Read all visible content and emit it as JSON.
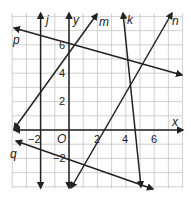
{
  "graph": {
    "axes": {
      "x_label": "x",
      "y_label": "y",
      "origin_label": "O"
    },
    "x_ticks": [
      {
        "value": -2,
        "label": "−2"
      },
      {
        "value": 2,
        "label": "2"
      },
      {
        "value": 4,
        "label": "4"
      },
      {
        "value": 6,
        "label": "6"
      }
    ],
    "y_ticks": [
      {
        "value": 6,
        "label": "6"
      },
      {
        "value": 4,
        "label": "4"
      },
      {
        "value": 2,
        "label": "2"
      },
      {
        "value": -2,
        "label": "−2"
      }
    ],
    "grid": {
      "x_min": -4,
      "x_max": 8,
      "y_min": -4,
      "y_max": 8
    },
    "lines": [
      {
        "name": "j",
        "label": "j"
      },
      {
        "name": "k",
        "label": "k"
      },
      {
        "name": "m",
        "label": "m"
      },
      {
        "name": "n",
        "label": "n"
      },
      {
        "name": "p",
        "label": "p"
      },
      {
        "name": "q",
        "label": "q"
      }
    ],
    "colors": {
      "line": "#222222",
      "grid": "#bfbfbf",
      "background": "#ffffff"
    }
  }
}
